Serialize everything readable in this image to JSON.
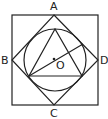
{
  "diagram": {
    "labels": {
      "A": "A",
      "B": "B",
      "C": "C",
      "D": "D",
      "O": "O"
    },
    "colors": {
      "stroke": "#222222",
      "background": "#ffffff"
    },
    "shapes": {
      "outer_square": "square",
      "rhombus": "ABCD",
      "circle": "circle with center O",
      "triangle": "inscribed triangle",
      "segment": "line through O"
    }
  }
}
